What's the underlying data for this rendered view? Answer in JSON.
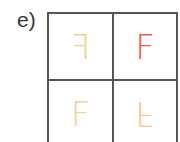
{
  "label": "e)",
  "grid": {
    "cells": [
      {
        "letter": "F",
        "transform": "scaleX(-1)",
        "color": "#f7cf8a",
        "name": "cell-top-left"
      },
      {
        "letter": "F",
        "transform": "none",
        "color": "#ef5a3a",
        "name": "cell-top-right"
      },
      {
        "letter": "F",
        "transform": "none",
        "color": "#f9cf99",
        "name": "cell-bottom-left"
      },
      {
        "letter": "F",
        "transform": "scaleY(-1)",
        "color": "#f4c88a",
        "name": "cell-bottom-right"
      }
    ],
    "line_color": "#555555"
  }
}
